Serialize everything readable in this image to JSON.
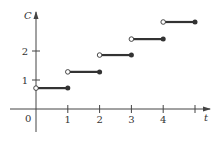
{
  "chart_data": {
    "type": "line",
    "subtype": "step",
    "title": "",
    "xlabel": "t",
    "ylabel": "C",
    "origin_label": "0",
    "x_ticks": [
      1,
      2,
      3,
      4,
      5
    ],
    "x_tick_labels": [
      "1",
      "2",
      "3",
      "4",
      ""
    ],
    "y_ticks": [
      1,
      2
    ],
    "y_tick_labels": [
      "1",
      "2"
    ],
    "xlim": [
      -0.8,
      5.5
    ],
    "ylim": [
      -0.8,
      3.3
    ],
    "grid": false,
    "legend": null,
    "segments": [
      {
        "x_start": 0,
        "x_end": 1,
        "y": 0.72,
        "left": "open",
        "right": "closed"
      },
      {
        "x_start": 1,
        "x_end": 2,
        "y": 1.28,
        "left": "open",
        "right": "closed"
      },
      {
        "x_start": 2,
        "x_end": 3,
        "y": 1.86,
        "left": "open",
        "right": "closed"
      },
      {
        "x_start": 3,
        "x_end": 4,
        "y": 2.41,
        "left": "open",
        "right": "closed"
      },
      {
        "x_start": 4,
        "x_end": 5,
        "y": 3.0,
        "left": "open",
        "right": "closed"
      }
    ]
  },
  "colors": {
    "axis": "#444444",
    "segment": "#333333",
    "text": "#333333"
  }
}
